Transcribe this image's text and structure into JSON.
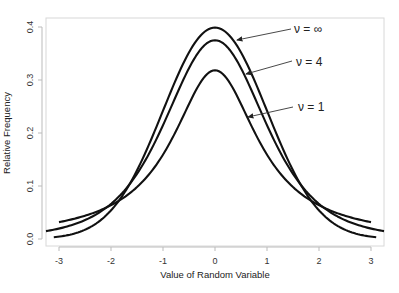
{
  "chart_data": {
    "type": "line",
    "title": "",
    "xlabel": "Value of Random Variable",
    "ylabel": "Relative Frequency",
    "xlim": [
      -3.25,
      3.25
    ],
    "ylim": [
      0.0,
      0.4
    ],
    "grid": false,
    "legend": "none (arrow annotations)",
    "x_ticks": [
      -3,
      -2,
      -1,
      0,
      1,
      2,
      3
    ],
    "x_tick_labels": [
      "-3",
      "-2",
      "-1",
      "0",
      "1",
      "2",
      "3"
    ],
    "y_ticks": [
      0.0,
      0.1,
      0.2,
      0.3,
      0.4
    ],
    "y_tick_labels": [
      "0.0",
      "0.1",
      "0.2",
      "0.3",
      "0.4"
    ],
    "series": [
      {
        "name": "ν = ∞",
        "distribution": "normal",
        "df": "inf",
        "domain": [
          -3.1,
          3.1
        ],
        "x": [
          -3,
          -2,
          -1,
          0,
          1,
          2,
          3
        ],
        "values": [
          0.004,
          0.054,
          0.242,
          0.399,
          0.242,
          0.054,
          0.004
        ]
      },
      {
        "name": "ν = 4",
        "distribution": "student-t",
        "df": 4,
        "domain": [
          -3.25,
          3.25
        ],
        "x": [
          -3,
          -2,
          -1,
          0,
          1,
          2,
          3
        ],
        "values": [
          0.02,
          0.066,
          0.215,
          0.375,
          0.215,
          0.066,
          0.02
        ]
      },
      {
        "name": "ν = 1",
        "distribution": "student-t (Cauchy)",
        "df": 1,
        "domain": [
          -3.0,
          3.0
        ],
        "x": [
          -3,
          -2,
          -1,
          0,
          1,
          2,
          3
        ],
        "values": [
          0.032,
          0.064,
          0.159,
          0.318,
          0.159,
          0.064,
          0.032
        ]
      }
    ],
    "annotations": [
      {
        "text": "ν = ∞",
        "points_to": "normal curve near x=0.4"
      },
      {
        "text": "ν = 4",
        "points_to": "t(4) curve near x=0.6"
      },
      {
        "text": "ν = 1",
        "points_to": "t(1) curve near x=0.6"
      }
    ]
  },
  "labels": {
    "xlabel": "Value of Random Variable",
    "ylabel": "Relative Frequency",
    "anno_inf": "ν = ∞",
    "anno_4": "ν = 4",
    "anno_1": "ν = 1"
  }
}
